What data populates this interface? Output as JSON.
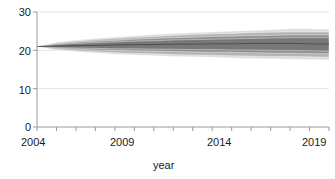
{
  "chart_data": {
    "type": "area",
    "title": "",
    "subtitle": "",
    "xlabel": "year",
    "ylabel": "",
    "xlim": [
      2004,
      2019
    ],
    "ylim": [
      0,
      30
    ],
    "grid": true,
    "legend": "none",
    "x_ticks": [
      2004,
      2005,
      2006,
      2007,
      2008,
      2009,
      2010,
      2011,
      2012,
      2013,
      2014,
      2015,
      2016,
      2017,
      2018,
      2019
    ],
    "x_tick_labels": [
      "2004",
      "",
      "",
      "",
      "",
      "2009",
      "",
      "",
      "",
      "",
      "2014",
      "",
      "",
      "",
      "",
      "2019"
    ],
    "y_ticks": [
      0,
      10,
      20,
      30
    ],
    "y_tick_labels": [
      "0",
      "10",
      "20",
      "30"
    ],
    "x": [
      2004,
      2005,
      2006,
      2007,
      2008,
      2009,
      2010,
      2011,
      2012,
      2013,
      2014,
      2015,
      2016,
      2017,
      2018,
      2019
    ],
    "series": [
      {
        "name": "median",
        "role": "center-line",
        "color": "#4a4a4a",
        "values": [
          21.0,
          21.1,
          21.2,
          21.3,
          21.4,
          21.5,
          21.5,
          21.6,
          21.6,
          21.7,
          21.7,
          21.8,
          21.8,
          21.8,
          21.7,
          21.6
        ]
      },
      {
        "name": "50% interval",
        "role": "band",
        "color": "#787878",
        "lower": [
          21.0,
          20.7,
          20.6,
          20.5,
          20.4,
          20.4,
          20.3,
          20.3,
          20.2,
          20.2,
          20.1,
          20.1,
          20.0,
          20.0,
          19.9,
          19.8
        ],
        "upper": [
          21.0,
          21.5,
          21.8,
          22.0,
          22.2,
          22.4,
          22.5,
          22.7,
          22.8,
          22.9,
          23.0,
          23.1,
          23.2,
          23.3,
          23.3,
          23.3
        ]
      },
      {
        "name": "70% interval",
        "role": "band",
        "color": "#8e8e8e",
        "lower": [
          21.0,
          20.5,
          20.3,
          20.1,
          20.0,
          19.9,
          19.8,
          19.7,
          19.6,
          19.5,
          19.5,
          19.4,
          19.3,
          19.3,
          19.2,
          19.1
        ],
        "upper": [
          21.0,
          21.7,
          22.1,
          22.4,
          22.6,
          22.9,
          23.1,
          23.3,
          23.4,
          23.6,
          23.7,
          23.8,
          23.9,
          24.0,
          24.0,
          24.0
        ]
      },
      {
        "name": "90% interval",
        "role": "band",
        "color": "#b4b4b4",
        "lower": [
          21.0,
          20.2,
          19.9,
          19.6,
          19.4,
          19.2,
          19.1,
          18.9,
          18.8,
          18.7,
          18.6,
          18.5,
          18.4,
          18.4,
          18.3,
          18.2
        ],
        "upper": [
          21.0,
          21.9,
          22.4,
          22.8,
          23.1,
          23.4,
          23.6,
          23.9,
          24.1,
          24.3,
          24.4,
          24.6,
          24.7,
          24.8,
          24.8,
          24.8
        ]
      },
      {
        "name": "95% interval",
        "role": "band",
        "color": "#dcdcdc",
        "lower": [
          21.0,
          20.0,
          19.6,
          19.3,
          19.0,
          18.8,
          18.6,
          18.4,
          18.3,
          18.2,
          18.0,
          17.9,
          17.8,
          17.7,
          17.6,
          17.5
        ],
        "upper": [
          21.0,
          22.1,
          22.7,
          23.1,
          23.5,
          23.8,
          24.1,
          24.4,
          24.6,
          24.8,
          25.0,
          25.2,
          25.4,
          25.6,
          25.6,
          25.5
        ]
      }
    ]
  },
  "axes": {
    "x_title": "year",
    "x_labels": [
      "2004",
      "2009",
      "2014",
      "2019"
    ],
    "y_labels": [
      "30",
      "20",
      "10",
      "0"
    ]
  },
  "colors": {
    "background": "#ffffff",
    "axis": "#9a9a9a",
    "gridline": "#e3e3e3",
    "text": "#1a1a1a",
    "band_outer": "#dcdcdc",
    "band_mid_outer": "#b4b4b4",
    "band_mid_inner": "#8e8e8e",
    "band_inner": "#787878",
    "median_line": "#4a4a4a"
  }
}
